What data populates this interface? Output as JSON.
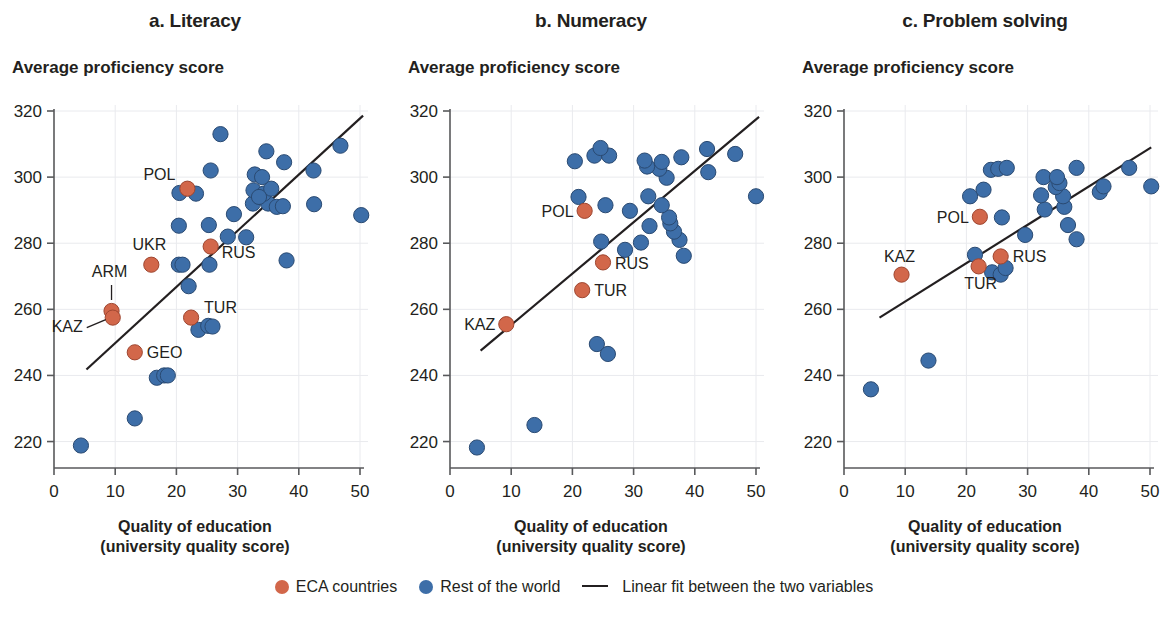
{
  "figure": {
    "x_axis_title_line1": "Quality of education",
    "x_axis_title_line2": "(university quality score)",
    "y_axis_title": "Average proficiency score"
  },
  "legend": {
    "eca_label": "ECA countries",
    "row_label": "Rest of the world",
    "fit_label": "Linear fit between the two variables",
    "eca_color": "#d2674a",
    "row_color": "#3d6ea8",
    "fit_color": "#231f20"
  },
  "chart_data": [
    {
      "type": "scatter",
      "title": "a. Literacy",
      "xlabel": "Quality of education (university quality score)",
      "ylabel": "Average proficiency score",
      "xlim": [
        0,
        50
      ],
      "ylim": [
        212,
        320
      ],
      "xticks": [
        0,
        10,
        20,
        30,
        40,
        50
      ],
      "yticks": [
        220,
        240,
        260,
        280,
        300,
        320
      ],
      "grid": true,
      "legend_position": "bottom",
      "series": [
        {
          "name": "ECA countries",
          "color": "#d2674a",
          "points": [
            {
              "label": "ARM",
              "x": 9.4,
              "y": 259.5
            },
            {
              "label": "KAZ",
              "x": 9.6,
              "y": 257.5
            },
            {
              "label": "GEO",
              "x": 13.2,
              "y": 247.0
            },
            {
              "label": "UKR",
              "x": 15.9,
              "y": 273.5
            },
            {
              "label": "POL",
              "x": 21.8,
              "y": 296.5
            },
            {
              "label": "RUS",
              "x": 25.6,
              "y": 279.0
            },
            {
              "label": "TUR",
              "x": 22.4,
              "y": 257.5
            }
          ]
        },
        {
          "name": "Rest of the world",
          "color": "#3d6ea8",
          "points": [
            {
              "x": 4.4,
              "y": 218.8
            },
            {
              "x": 13.2,
              "y": 227.0
            },
            {
              "x": 16.8,
              "y": 239.3
            },
            {
              "x": 18.0,
              "y": 240.0
            },
            {
              "x": 18.6,
              "y": 240.0
            },
            {
              "x": 23.6,
              "y": 253.8
            },
            {
              "x": 25.2,
              "y": 255.0
            },
            {
              "x": 25.9,
              "y": 254.8
            },
            {
              "x": 22.0,
              "y": 267.0
            },
            {
              "x": 20.4,
              "y": 273.5
            },
            {
              "x": 21.0,
              "y": 273.5
            },
            {
              "x": 25.4,
              "y": 273.5
            },
            {
              "x": 38.0,
              "y": 274.8
            },
            {
              "x": 28.4,
              "y": 282.0
            },
            {
              "x": 31.4,
              "y": 281.8
            },
            {
              "x": 20.4,
              "y": 285.3
            },
            {
              "x": 25.3,
              "y": 285.5
            },
            {
              "x": 29.4,
              "y": 288.8
            },
            {
              "x": 50.2,
              "y": 288.5
            },
            {
              "x": 20.5,
              "y": 295.2
            },
            {
              "x": 23.2,
              "y": 295.0
            },
            {
              "x": 32.5,
              "y": 292.0
            },
            {
              "x": 35.0,
              "y": 292.0
            },
            {
              "x": 36.4,
              "y": 291.0
            },
            {
              "x": 37.4,
              "y": 291.2
            },
            {
              "x": 42.5,
              "y": 291.8
            },
            {
              "x": 32.6,
              "y": 296.0
            },
            {
              "x": 34.3,
              "y": 295.0
            },
            {
              "x": 35.5,
              "y": 296.5
            },
            {
              "x": 33.5,
              "y": 294.0
            },
            {
              "x": 32.8,
              "y": 300.8
            },
            {
              "x": 34.0,
              "y": 300.0
            },
            {
              "x": 25.6,
              "y": 302.0
            },
            {
              "x": 42.4,
              "y": 302.0
            },
            {
              "x": 37.6,
              "y": 304.5
            },
            {
              "x": 34.7,
              "y": 307.8
            },
            {
              "x": 46.8,
              "y": 309.5
            },
            {
              "x": 27.2,
              "y": 313.0
            }
          ]
        }
      ],
      "fit_line": {
        "x1": 5.3,
        "y1": 241.8,
        "x2": 50.5,
        "y2": 318.6
      }
    },
    {
      "type": "scatter",
      "title": "b. Numeracy",
      "xlabel": "Quality of education (university quality score)",
      "ylabel": "Average proficiency score",
      "xlim": [
        0,
        50
      ],
      "ylim": [
        212,
        320
      ],
      "xticks": [
        0,
        10,
        20,
        30,
        40,
        50
      ],
      "yticks": [
        220,
        240,
        260,
        280,
        300,
        320
      ],
      "grid": true,
      "legend_position": "bottom",
      "series": [
        {
          "name": "ECA countries",
          "color": "#d2674a",
          "points": [
            {
              "label": "KAZ",
              "x": 9.2,
              "y": 255.5
            },
            {
              "label": "TUR",
              "x": 21.6,
              "y": 265.8
            },
            {
              "label": "RUS",
              "x": 25.0,
              "y": 274.2
            },
            {
              "label": "POL",
              "x": 22.0,
              "y": 289.8
            }
          ]
        },
        {
          "name": "Rest of the world",
          "color": "#3d6ea8",
          "points": [
            {
              "x": 4.4,
              "y": 218.2
            },
            {
              "x": 13.8,
              "y": 225.0
            },
            {
              "x": 24.0,
              "y": 249.5
            },
            {
              "x": 25.8,
              "y": 246.5
            },
            {
              "x": 38.2,
              "y": 276.2
            },
            {
              "x": 28.6,
              "y": 278.0
            },
            {
              "x": 24.7,
              "y": 280.5
            },
            {
              "x": 31.2,
              "y": 280.2
            },
            {
              "x": 37.5,
              "y": 281.0
            },
            {
              "x": 36.6,
              "y": 283.5
            },
            {
              "x": 32.6,
              "y": 285.2
            },
            {
              "x": 36.0,
              "y": 286.0
            },
            {
              "x": 35.8,
              "y": 287.8
            },
            {
              "x": 29.4,
              "y": 289.8
            },
            {
              "x": 25.4,
              "y": 291.5
            },
            {
              "x": 34.6,
              "y": 291.5
            },
            {
              "x": 32.4,
              "y": 294.2
            },
            {
              "x": 21.0,
              "y": 294.0
            },
            {
              "x": 50.0,
              "y": 294.2
            },
            {
              "x": 42.2,
              "y": 301.5
            },
            {
              "x": 35.4,
              "y": 299.8
            },
            {
              "x": 34.2,
              "y": 302.5
            },
            {
              "x": 32.2,
              "y": 303.2
            },
            {
              "x": 20.4,
              "y": 304.8
            },
            {
              "x": 31.8,
              "y": 305.0
            },
            {
              "x": 34.6,
              "y": 304.6
            },
            {
              "x": 23.6,
              "y": 306.5
            },
            {
              "x": 26.0,
              "y": 306.5
            },
            {
              "x": 37.8,
              "y": 306.0
            },
            {
              "x": 46.6,
              "y": 307.0
            },
            {
              "x": 24.6,
              "y": 308.8
            },
            {
              "x": 42.0,
              "y": 308.5
            }
          ]
        }
      ],
      "fit_line": {
        "x1": 5.0,
        "y1": 247.5,
        "x2": 50.5,
        "y2": 318.2
      }
    },
    {
      "type": "scatter",
      "title": "c. Problem solving",
      "xlabel": "Quality of education (university quality score)",
      "ylabel": "Average proficiency score",
      "xlim": [
        0,
        50
      ],
      "ylim": [
        212,
        320
      ],
      "xticks": [
        0,
        10,
        20,
        30,
        40,
        50
      ],
      "yticks": [
        220,
        240,
        260,
        280,
        300,
        320
      ],
      "grid": true,
      "legend_position": "bottom",
      "series": [
        {
          "name": "ECA countries",
          "color": "#d2674a",
          "points": [
            {
              "label": "KAZ",
              "x": 9.4,
              "y": 270.5
            },
            {
              "label": "TUR",
              "x": 22.0,
              "y": 273.0
            },
            {
              "label": "RUS",
              "x": 25.6,
              "y": 276.0
            },
            {
              "label": "POL",
              "x": 22.2,
              "y": 288.0
            }
          ]
        },
        {
          "name": "Rest of the world",
          "color": "#3d6ea8",
          "points": [
            {
              "x": 4.4,
              "y": 235.8
            },
            {
              "x": 13.8,
              "y": 244.5
            },
            {
              "x": 24.2,
              "y": 271.2
            },
            {
              "x": 25.6,
              "y": 270.5
            },
            {
              "x": 26.4,
              "y": 272.5
            },
            {
              "x": 21.4,
              "y": 276.5
            },
            {
              "x": 38.0,
              "y": 281.2
            },
            {
              "x": 29.6,
              "y": 282.5
            },
            {
              "x": 36.6,
              "y": 285.5
            },
            {
              "x": 25.8,
              "y": 287.8
            },
            {
              "x": 32.8,
              "y": 290.2
            },
            {
              "x": 36.0,
              "y": 291.0
            },
            {
              "x": 20.6,
              "y": 294.2
            },
            {
              "x": 32.2,
              "y": 294.5
            },
            {
              "x": 35.8,
              "y": 294.2
            },
            {
              "x": 22.8,
              "y": 296.2
            },
            {
              "x": 41.8,
              "y": 295.5
            },
            {
              "x": 42.4,
              "y": 297.2
            },
            {
              "x": 50.2,
              "y": 297.2
            },
            {
              "x": 34.6,
              "y": 297.0
            },
            {
              "x": 35.2,
              "y": 298.2
            },
            {
              "x": 32.6,
              "y": 300.0
            },
            {
              "x": 34.8,
              "y": 300.0
            },
            {
              "x": 24.0,
              "y": 302.2
            },
            {
              "x": 25.2,
              "y": 302.5
            },
            {
              "x": 26.6,
              "y": 302.8
            },
            {
              "x": 38.0,
              "y": 302.8
            },
            {
              "x": 46.6,
              "y": 302.8
            }
          ]
        }
      ],
      "fit_line": {
        "x1": 5.8,
        "y1": 257.5,
        "x2": 50.2,
        "y2": 309.0
      }
    }
  ]
}
